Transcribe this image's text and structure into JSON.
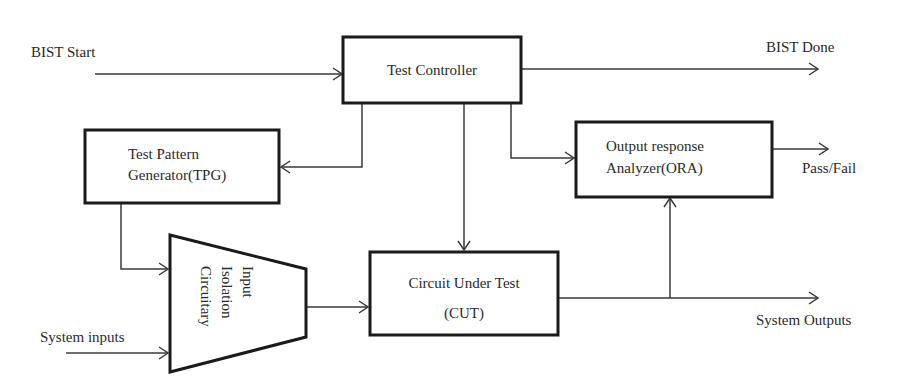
{
  "diagram": {
    "blocks": {
      "test_controller": {
        "label": "Test Controller"
      },
      "tpg": {
        "line1": "Test Pattern",
        "line2": "Generator(TPG)"
      },
      "ora": {
        "line1": "Output response",
        "line2": "Analyzer(ORA)"
      },
      "cut": {
        "line1": "Circuit Under Test",
        "line2": "(CUT)"
      },
      "isolation": {
        "line1": "Input",
        "line2": "Isolation",
        "line3": "Circuitary"
      }
    },
    "signals": {
      "bist_start": "BIST Start",
      "bist_done": "BIST Done",
      "pass_fail": "Pass/Fail",
      "system_inputs": "System inputs",
      "system_outputs": "System Outputs"
    },
    "colors": {
      "stroke": "#1a1a1a",
      "wire": "#3a3a3a",
      "text": "#2a2a2a",
      "background": "#ffffff"
    }
  }
}
